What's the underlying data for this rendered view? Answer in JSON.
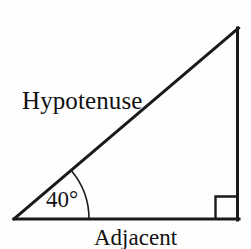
{
  "figure": {
    "kind": "right-triangle-trigonometry-diagram",
    "background_color": "#fefefe",
    "stroke_color": "#1a1a1a",
    "text_color": "#111111",
    "stroke_width": 3,
    "arc_stroke_width": 1.6,
    "labels": {
      "hypotenuse": "Hypotenuse",
      "angle": "40°",
      "adjacent": "Adjacent"
    },
    "geometry": {
      "angle_vertex": {
        "x": 14,
        "y": 219
      },
      "right_angle_vertex": {
        "x": 238,
        "y": 219
      },
      "apex": {
        "x": 238,
        "y": 28
      },
      "angle_degrees": 40,
      "arc_radius": 75,
      "right_angle_marker_size": 22
    }
  }
}
